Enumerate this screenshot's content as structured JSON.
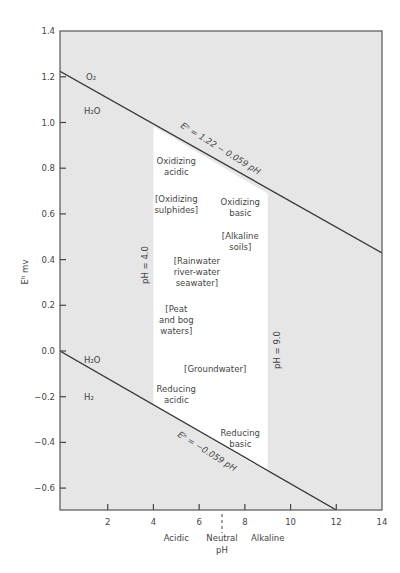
{
  "chart_data": {
    "type": "line",
    "title": "",
    "xlabel": "pH",
    "ylabel": "Eʰ mv",
    "xlim": [
      0,
      14
    ],
    "ylim": [
      -0.7,
      1.4
    ],
    "grid": false,
    "xticks": [
      2,
      4,
      6,
      8,
      10,
      12,
      14
    ],
    "yticks": [
      1.4,
      1.2,
      1.0,
      0.8,
      0.6,
      0.4,
      0.2,
      0.0,
      -0.2,
      -0.4,
      -0.6
    ],
    "ytick_labels": [
      "1.4",
      "1.2",
      "1.0",
      "0.8",
      "0.6",
      "0.4",
      "0.2",
      "0.0",
      "−0.2",
      "−0.4",
      "−0.6"
    ],
    "neutral_ph": 7,
    "series": [
      {
        "name": "Eh = 1.22 − 0.059 pH",
        "intercept": 1.22,
        "slope": -0.059,
        "x": [
          0,
          14
        ],
        "y": [
          1.22,
          0.394
        ]
      },
      {
        "name": "Eh = −0.059 pH",
        "intercept": 0.0,
        "slope": -0.059,
        "x": [
          0,
          12
        ],
        "y": [
          0.0,
          -0.708
        ]
      }
    ],
    "natural_waters_region": {
      "ph_min": 4.0,
      "ph_max": 9.0,
      "fill": "#ffffff"
    },
    "background_fill": "#e6e6e6",
    "line_color": "#333333",
    "annotations": {
      "upper_above": "O₂",
      "upper_below": "H₂O",
      "lower_above": "H₂O",
      "lower_below": "H₂",
      "upper_equation": "Eʰ = 1.22 − 0.059 pH",
      "lower_equation": "Eʰ = −0.059 pH",
      "ph4_label": "pH = 4.0",
      "ph9_label": "pH = 9.0"
    },
    "region_labels": [
      {
        "lines": [
          "Oxidizing",
          "acidic"
        ],
        "x": 5.0,
        "y": 0.82
      },
      {
        "lines": [
          "[Oxidizing",
          "sulphides]"
        ],
        "x": 5.0,
        "y": 0.65
      },
      {
        "lines": [
          "Oxidizing",
          "basic"
        ],
        "x": 7.8,
        "y": 0.64
      },
      {
        "lines": [
          "[Alkaline",
          "soils]"
        ],
        "x": 7.8,
        "y": 0.49
      },
      {
        "lines": [
          "[Rainwater",
          "river-water",
          "seawater]"
        ],
        "x": 5.9,
        "y": 0.38
      },
      {
        "lines": [
          "[Peat",
          "and bog",
          "waters]"
        ],
        "x": 5.0,
        "y": 0.17
      },
      {
        "lines": [
          "[Groundwater]"
        ],
        "x": 6.7,
        "y": -0.09
      },
      {
        "lines": [
          "Reducing",
          "acidic"
        ],
        "x": 5.0,
        "y": -0.18
      },
      {
        "lines": [
          "Reducing",
          "basic"
        ],
        "x": 7.8,
        "y": -0.37
      }
    ],
    "x_category_labels": [
      {
        "lines": [
          "Acidic"
        ],
        "x": 5.0
      },
      {
        "lines": [
          "Neutral",
          "pH"
        ],
        "x": 7.0
      },
      {
        "lines": [
          "Alkaline"
        ],
        "x": 9.0
      }
    ]
  }
}
